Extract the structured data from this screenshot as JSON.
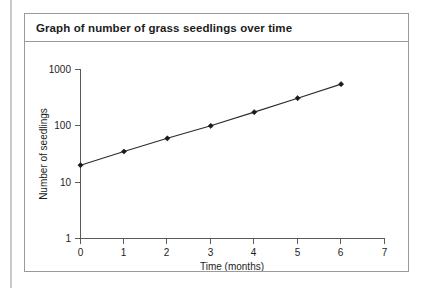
{
  "figure": {
    "title": "Graph of number of grass seedlings over time"
  },
  "chart_data": {
    "type": "line",
    "title": "Graph of number of grass seedlings over time",
    "xlabel": "Time (months)",
    "ylabel": "Number of seedlings",
    "x": [
      0,
      1,
      2,
      3,
      4,
      5,
      6
    ],
    "values": [
      20,
      35,
      60,
      100,
      175,
      310,
      550
    ],
    "series": [
      {
        "name": "Number of seedlings",
        "values": [
          20,
          35,
          60,
          100,
          175,
          310,
          550
        ]
      }
    ],
    "xlim": [
      0,
      7
    ],
    "ylim": [
      1,
      1000
    ],
    "yscale": "log",
    "xscale": "linear",
    "xticks": [
      "0",
      "1",
      "2",
      "3",
      "4",
      "5",
      "6",
      "7"
    ],
    "xtick_values": [
      0,
      1,
      2,
      3,
      4,
      5,
      6,
      7
    ],
    "yticks": [
      "1",
      "10",
      "100",
      "1000"
    ],
    "ytick_values": [
      1,
      10,
      100,
      1000
    ],
    "grid": false,
    "legend": false,
    "marker": "diamond",
    "line_color": "#2b2b2b",
    "marker_color": "#1a1a1a"
  }
}
